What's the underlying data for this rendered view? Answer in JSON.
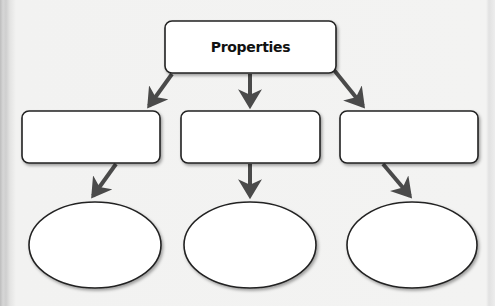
{
  "diagram": {
    "type": "graphic-organizer",
    "root": {
      "label": "Properties"
    },
    "level1_boxes": [
      {
        "label": ""
      },
      {
        "label": ""
      },
      {
        "label": ""
      }
    ],
    "level2_ovals": [
      {
        "label": ""
      },
      {
        "label": ""
      },
      {
        "label": ""
      }
    ],
    "colors": {
      "stroke": "#222222",
      "arrow": "#4a4a4a",
      "fill": "#ffffff",
      "background": "#f2f2f1"
    }
  }
}
